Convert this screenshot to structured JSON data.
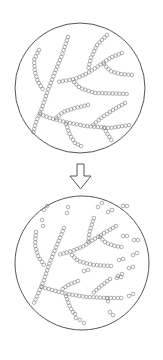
{
  "diagram": {
    "colors": {
      "background": "#ffffff",
      "outline": "#555555",
      "bead": "#7a7a7a",
      "arrow": "#444444"
    },
    "bead_radius": 1.8,
    "bead_spacing": 3.5,
    "panels": [
      {
        "name": "intact-chains",
        "circle": {
          "cx": 80,
          "cy": 88,
          "r": 65
        },
        "chains": [
          [
            [
              39,
              50
            ],
            [
              34,
              60
            ],
            [
              35,
              72
            ],
            [
              38,
              82
            ],
            [
              44,
              91
            ]
          ],
          [
            [
              68,
              37
            ],
            [
              62,
              55
            ],
            [
              55,
              72
            ],
            [
              48,
              90
            ],
            [
              42,
              108
            ],
            [
              36,
              122
            ],
            [
              33,
              134
            ]
          ],
          [
            [
              107,
              35
            ],
            [
              97,
              45
            ],
            [
              91,
              58
            ],
            [
              88,
              70
            ]
          ],
          [
            [
              122,
              53
            ],
            [
              110,
              58
            ],
            [
              100,
              65
            ],
            [
              88,
              73
            ],
            [
              75,
              79
            ],
            [
              58,
              82
            ]
          ],
          [
            [
              104,
              64
            ],
            [
              110,
              71
            ],
            [
              120,
              74
            ],
            [
              133,
              75
            ]
          ],
          [
            [
              74,
              82
            ],
            [
              80,
              88
            ],
            [
              95,
              93
            ],
            [
              129,
              94
            ]
          ],
          [
            [
              88,
              105
            ],
            [
              75,
              108
            ],
            [
              63,
              112
            ],
            [
              55,
              119
            ]
          ],
          [
            [
              125,
              103
            ],
            [
              113,
              110
            ],
            [
              101,
              118
            ],
            [
              93,
              125
            ]
          ],
          [
            [
              40,
              114
            ],
            [
              50,
              118
            ],
            [
              65,
              122
            ],
            [
              85,
              126
            ],
            [
              110,
              128
            ],
            [
              130,
              125
            ]
          ],
          [
            [
              66,
              124
            ],
            [
              70,
              135
            ],
            [
              75,
              143
            ],
            [
              83,
              147
            ]
          ],
          [
            [
              104,
              128
            ],
            [
              108,
              135
            ],
            [
              112,
              141
            ]
          ]
        ]
      },
      {
        "name": "fragmented-chains",
        "circle": {
          "cx": 82,
          "cy": 263,
          "r": 67
        },
        "chains": [
          [
            [
              36,
              232
            ],
            [
              35,
              245
            ],
            [
              38,
              256
            ],
            [
              44,
              265
            ]
          ],
          [
            [
              64,
              228
            ],
            [
              57,
              245
            ],
            [
              50,
              262
            ],
            [
              44,
              280
            ],
            [
              38,
              294
            ],
            [
              33,
              305
            ]
          ],
          [
            [
              94,
              218
            ],
            [
              90,
              230
            ],
            [
              88,
              242
            ]
          ],
          [
            [
              116,
              226
            ],
            [
              106,
              232
            ],
            [
              96,
              238
            ],
            [
              84,
              246
            ],
            [
              72,
              251
            ],
            [
              58,
              255
            ]
          ],
          [
            [
              100,
              237
            ],
            [
              106,
              243
            ],
            [
              115,
              246
            ],
            [
              122,
              247
            ]
          ],
          [
            [
              72,
              255
            ],
            [
              78,
              261
            ],
            [
              93,
              265
            ],
            [
              112,
              266
            ]
          ],
          [
            [
              78,
              281
            ],
            [
              68,
              285
            ],
            [
              60,
              291
            ]
          ],
          [
            [
              110,
              279
            ],
            [
              101,
              286
            ],
            [
              93,
              293
            ]
          ],
          [
            [
              42,
              287
            ],
            [
              52,
              290
            ],
            [
              67,
              294
            ],
            [
              87,
              297
            ],
            [
              108,
              298
            ],
            [
              122,
              298
            ]
          ],
          [
            [
              66,
              296
            ],
            [
              70,
              307
            ],
            [
              73,
              312
            ]
          ],
          [
            [
              107,
              298
            ],
            [
              109,
              304
            ]
          ]
        ],
        "fragments": [
          [
            [
              68,
              207
            ],
            [
              67,
              213
            ]
          ],
          [
            [
              42,
              220
            ],
            [
              43,
              226
            ]
          ],
          [
            [
              44,
              210
            ],
            [
              47,
              206
            ]
          ],
          [
            [
              98,
              207
            ],
            [
              102,
              203
            ]
          ],
          [
            [
              108,
              212
            ],
            [
              112,
              210
            ]
          ],
          [
            [
              123,
              206
            ],
            [
              127,
              206
            ]
          ],
          [
            [
              123,
              236
            ],
            [
              127,
              236
            ]
          ],
          [
            [
              134,
              240
            ],
            [
              138,
              240
            ]
          ],
          [
            [
              119,
              260
            ],
            [
              123,
              259
            ]
          ],
          [
            [
              133,
              255
            ],
            [
              137,
              253
            ]
          ],
          [
            [
              118,
              276
            ],
            [
              122,
              274
            ]
          ],
          [
            [
              129,
              268
            ],
            [
              133,
              267
            ]
          ],
          [
            [
              129,
              296
            ],
            [
              133,
              294
            ]
          ],
          [
            [
              110,
              312
            ],
            [
              113,
              315
            ]
          ],
          [
            [
              80,
              320
            ],
            [
              84,
              323
            ]
          ],
          [
            [
              75,
              314
            ],
            [
              76,
              318
            ]
          ],
          [
            [
              117,
              278
            ],
            [
              121,
              277
            ]
          ],
          [
            [
              84,
              271
            ],
            [
              88,
              270
            ]
          ]
        ]
      }
    ],
    "arrow": {
      "direction": "down",
      "shaft": {
        "x1": 77,
        "x2": 84,
        "y1": 164,
        "y2": 176
      },
      "head": {
        "x1": 70,
        "x2": 91,
        "y": 176,
        "tip_y": 189
      }
    }
  }
}
